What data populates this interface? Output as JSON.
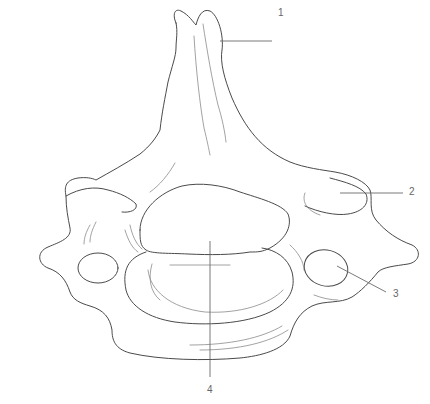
{
  "figure": {
    "line_color": "#4a4a4a",
    "label_color": "#666666",
    "labels": [
      {
        "number": "1",
        "x": 278,
        "y": 8
      },
      {
        "number": "2",
        "x": 409,
        "y": 187
      },
      {
        "number": "3",
        "x": 393,
        "y": 289
      },
      {
        "number": "4",
        "x": 207,
        "y": 385
      }
    ]
  }
}
